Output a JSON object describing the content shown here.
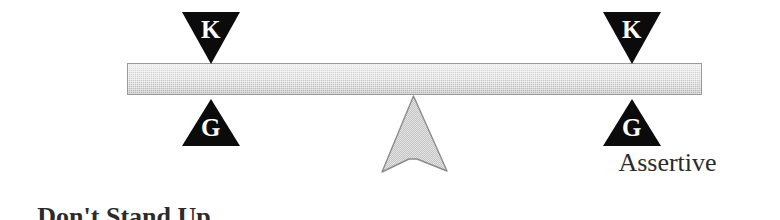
{
  "diagram": {
    "background_color": "#ffffff",
    "beam": {
      "name": "balance-beam",
      "fill_color": "#c9c9c9",
      "border_color": "#9a9a9a"
    },
    "fulcrum": {
      "name": "fulcrum-arrow",
      "fill_color": "#c2c2c2",
      "border_color": "#8c8c8c"
    },
    "markers": [
      {
        "side": "left",
        "above": {
          "glyph": "K",
          "icon": "down-triangle-icon",
          "color": "#0b0b0b"
        },
        "below": {
          "glyph": "G",
          "icon": "up-triangle-icon",
          "color": "#0b0b0b"
        }
      },
      {
        "side": "right",
        "above": {
          "glyph": "K",
          "icon": "down-triangle-icon",
          "color": "#0b0b0b"
        },
        "below": {
          "glyph": "G",
          "icon": "up-triangle-icon",
          "color": "#0b0b0b"
        }
      }
    ],
    "labels": {
      "left": {
        "lines": [
          "Don't Stand Up",
          "For Myself"
        ],
        "line1": "Don't Stand Up",
        "line2": "For Myself",
        "weight": "bold",
        "color": "#2b2b2b"
      },
      "right": {
        "text": "Assertive",
        "weight": "normal",
        "color": "#2b2b2b"
      }
    }
  }
}
